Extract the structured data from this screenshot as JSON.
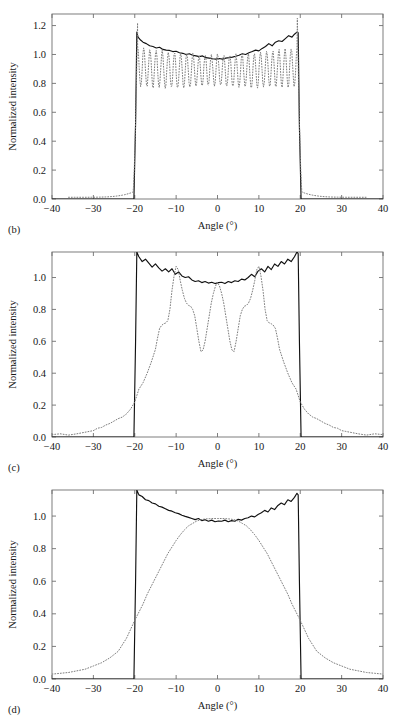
{
  "figure": {
    "title": "",
    "panel_count": 3
  },
  "chart_data": [
    {
      "type": "line",
      "panel_label": "(b)",
      "title": "",
      "xlabel": "Angle (°)",
      "ylabel": "Normalized intensity",
      "xlim": [
        -40,
        40
      ],
      "ylim": [
        0,
        1.28
      ],
      "xticks": [
        -40,
        -30,
        -20,
        -10,
        0,
        10,
        20,
        30,
        40
      ],
      "xticklabels": [
        "-40",
        "-30",
        "-20",
        "-10",
        "0",
        "10",
        "20",
        "30",
        "40"
      ],
      "yticks": [
        0.0,
        0.2,
        0.4,
        0.6,
        0.8,
        1.0,
        1.2
      ],
      "yticklabels": [
        "0.0",
        "0.2",
        "0.4",
        "0.6",
        "0.8",
        "1.0",
        "1.2"
      ],
      "grid": false,
      "legend": "none",
      "series": [
        {
          "name": "measured",
          "style": "solid",
          "color": "#111111",
          "description": "Flat-top profile with noisy ripple, rising edges at -19.5 and +19.5 degrees, peaks ~1.155 at edges, dips to ~0.965 at center",
          "x": [
            -40,
            -22,
            -20.2,
            -19.8,
            -19.5,
            -19.2,
            -18.6,
            -18.0,
            -17.2,
            -16.4,
            -15.6,
            -14.8,
            -14.0,
            -13.2,
            -12.4,
            -11.6,
            -10.8,
            -10.0,
            -9.2,
            -8.4,
            -7.6,
            -6.8,
            -6.0,
            -5.2,
            -4.4,
            -3.6,
            -2.8,
            -2.0,
            -1.2,
            -0.4,
            0.4,
            1.2,
            2.0,
            2.8,
            3.6,
            4.4,
            5.2,
            6.0,
            6.8,
            7.6,
            8.4,
            9.2,
            10.0,
            10.8,
            11.6,
            12.4,
            13.2,
            14.0,
            14.8,
            15.6,
            16.4,
            17.2,
            18.0,
            18.6,
            19.2,
            19.5,
            19.8,
            20.2,
            22,
            40
          ],
          "y": [
            0.0,
            0.0,
            0.0,
            0.52,
            1.155,
            1.12,
            1.1,
            1.085,
            1.075,
            1.06,
            1.055,
            1.045,
            1.05,
            1.035,
            1.03,
            1.028,
            1.02,
            1.022,
            1.012,
            1.008,
            1.0,
            1.005,
            0.995,
            0.99,
            0.985,
            0.99,
            0.978,
            0.975,
            0.97,
            0.968,
            0.972,
            0.968,
            0.975,
            0.978,
            0.982,
            0.988,
            0.995,
            1.005,
            1.0,
            1.012,
            1.02,
            1.03,
            1.025,
            1.042,
            1.055,
            1.075,
            1.06,
            1.085,
            1.095,
            1.09,
            1.11,
            1.13,
            1.12,
            1.14,
            1.155,
            1.15,
            0.5,
            0.0,
            0.0,
            0.0
          ]
        },
        {
          "name": "simulated",
          "style": "dotted",
          "color": "#7d7d7d",
          "description": "Strongly oscillating interference pattern with many fringes inside the aperture, tails extending to +/-35 degrees, edge spikes reaching ~1.25",
          "fringe_count": 26,
          "fringe_min": 0.78,
          "fringe_max": 1.06,
          "edge_peak": 1.25,
          "tail_extent": 36
        }
      ]
    },
    {
      "type": "line",
      "panel_label": "(c)",
      "title": "",
      "xlabel": "Angle (°)",
      "ylabel": "Normalized intensity",
      "xlim": [
        -40,
        40
      ],
      "ylim": [
        0,
        1.16
      ],
      "xticks": [
        -40,
        -30,
        -20,
        -10,
        0,
        10,
        20,
        30,
        40
      ],
      "xticklabels": [
        "-40",
        "-30",
        "-20",
        "-10",
        "0",
        "10",
        "20",
        "30",
        "40"
      ],
      "yticks": [
        0.0,
        0.2,
        0.4,
        0.6,
        0.8,
        1.0
      ],
      "yticklabels": [
        "0.0",
        "0.2",
        "0.4",
        "0.6",
        "0.8",
        "1.0"
      ],
      "grid": false,
      "legend": "none",
      "series": [
        {
          "name": "measured",
          "style": "solid",
          "color": "#111111",
          "description": "Flat-top profile clipped at top of axis at the edges, noisy ripple around 0.96 - 1.10",
          "x": [
            -40,
            -20.2,
            -19.8,
            -19.5,
            -19.0,
            -18.2,
            -17.4,
            -16.6,
            -15.8,
            -15.0,
            -14.2,
            -13.4,
            -12.6,
            -11.8,
            -11.0,
            -10.2,
            -9.4,
            -8.6,
            -7.8,
            -7.0,
            -6.2,
            -5.4,
            -4.6,
            -3.8,
            -3.0,
            -2.2,
            -1.4,
            -0.6,
            0.2,
            1.0,
            1.8,
            2.6,
            3.4,
            4.2,
            5.0,
            5.8,
            6.6,
            7.4,
            8.2,
            9.0,
            9.8,
            10.6,
            11.4,
            12.2,
            13.0,
            13.8,
            14.6,
            15.4,
            16.2,
            17.0,
            17.8,
            18.6,
            19.2,
            19.5,
            19.8,
            20.2,
            40
          ],
          "y": [
            0.0,
            0.0,
            0.6,
            1.16,
            1.13,
            1.1,
            1.115,
            1.09,
            1.065,
            1.085,
            1.06,
            1.04,
            1.055,
            1.035,
            1.055,
            1.02,
            1.035,
            1.01,
            1.0,
            1.005,
            0.985,
            0.975,
            0.98,
            0.968,
            0.975,
            0.965,
            0.97,
            0.962,
            0.968,
            0.97,
            0.962,
            0.975,
            0.968,
            0.98,
            0.975,
            0.99,
            0.985,
            1.0,
            1.02,
            1.005,
            1.04,
            1.055,
            1.035,
            1.07,
            1.05,
            1.085,
            1.07,
            1.1,
            1.085,
            1.115,
            1.1,
            1.13,
            1.16,
            1.15,
            0.6,
            0.0,
            0.0
          ]
        },
        {
          "name": "simulated",
          "style": "dotted",
          "color": "#7d7d7d",
          "description": "Four-lobed interference profile: outer peaks ~1.07 at -11 and +11 degrees, central peak ~0.97 at 0 degrees, deep minima ~0.53 at -4 and +4 degrees, broad shoulders, tails to +/-38 degrees",
          "x": [
            -40,
            -38,
            -36,
            -34,
            -32,
            -31,
            -30,
            -29,
            -28,
            -27,
            -26,
            -25,
            -24,
            -23,
            -22,
            -21,
            -20,
            -19.5,
            -19,
            -18,
            -17,
            -16,
            -15,
            -14.5,
            -14,
            -13.5,
            -13,
            -12.5,
            -12,
            -11.5,
            -11,
            -10.5,
            -10,
            -9.5,
            -9,
            -8.5,
            -8,
            -7.5,
            -7,
            -6.5,
            -6,
            -5.5,
            -5,
            -4.5,
            -4,
            -3.5,
            -3,
            -2.5,
            -2,
            -1.5,
            -1,
            -0.5,
            0,
            0.5,
            1,
            1.5,
            2,
            2.5,
            3,
            3.5,
            4,
            4.5,
            5,
            5.5,
            6,
            6.5,
            7,
            7.5,
            8,
            8.5,
            9,
            9.5,
            10,
            10.5,
            11,
            11.5,
            12,
            12.5,
            13,
            13.5,
            14,
            14.5,
            15,
            16,
            17,
            18,
            19,
            19.5,
            20,
            21,
            22,
            23,
            24,
            25,
            26,
            27,
            28,
            29,
            30,
            31,
            32,
            34,
            36,
            38,
            40
          ],
          "y": [
            0.015,
            0.02,
            0.012,
            0.02,
            0.03,
            0.035,
            0.04,
            0.055,
            0.06,
            0.075,
            0.085,
            0.1,
            0.115,
            0.125,
            0.145,
            0.175,
            0.22,
            0.26,
            0.3,
            0.34,
            0.4,
            0.47,
            0.55,
            0.62,
            0.68,
            0.7,
            0.71,
            0.715,
            0.73,
            0.8,
            0.92,
            1.01,
            1.07,
            1.05,
            0.98,
            0.92,
            0.87,
            0.84,
            0.825,
            0.82,
            0.8,
            0.76,
            0.68,
            0.6,
            0.535,
            0.545,
            0.6,
            0.68,
            0.76,
            0.84,
            0.9,
            0.945,
            0.97,
            0.945,
            0.9,
            0.84,
            0.76,
            0.68,
            0.6,
            0.545,
            0.535,
            0.6,
            0.68,
            0.76,
            0.8,
            0.82,
            0.825,
            0.84,
            0.87,
            0.92,
            0.98,
            1.05,
            1.07,
            1.01,
            0.92,
            0.8,
            0.73,
            0.715,
            0.71,
            0.7,
            0.68,
            0.62,
            0.55,
            0.47,
            0.4,
            0.34,
            0.3,
            0.26,
            0.22,
            0.175,
            0.145,
            0.125,
            0.115,
            0.1,
            0.085,
            0.075,
            0.06,
            0.055,
            0.04,
            0.035,
            0.03,
            0.02,
            0.012,
            0.02,
            0.015
          ]
        }
      ]
    },
    {
      "type": "line",
      "panel_label": "(d)",
      "title": "",
      "xlabel": "Angle (°)",
      "ylabel": "Normalized intensity",
      "xlim": [
        -40,
        40
      ],
      "ylim": [
        0,
        1.16
      ],
      "xticks": [
        -40,
        -30,
        -20,
        -10,
        0,
        10,
        20,
        30,
        40
      ],
      "xticklabels": [
        "-40",
        "-30",
        "-20",
        "-10",
        "0",
        "10",
        "20",
        "30",
        "40"
      ],
      "yticks": [
        0.0,
        0.2,
        0.4,
        0.6,
        0.8,
        1.0
      ],
      "yticklabels": [
        "0.0",
        "0.2",
        "0.4",
        "0.6",
        "0.8",
        "1.0"
      ],
      "grid": false,
      "legend": "none",
      "series": [
        {
          "name": "measured",
          "style": "solid",
          "color": "#111111",
          "description": "Flat-top profile clipped at top of axis at the edges, shallow noisy ripple around 0.96 - 1.13",
          "x": [
            -40,
            -20.2,
            -19.8,
            -19.5,
            -19.0,
            -18.2,
            -17.4,
            -16.6,
            -15.8,
            -15.0,
            -14.2,
            -13.4,
            -12.6,
            -11.8,
            -11.0,
            -10.2,
            -9.4,
            -8.6,
            -7.8,
            -7.0,
            -6.2,
            -5.4,
            -4.6,
            -3.8,
            -3.0,
            -2.2,
            -1.4,
            -0.6,
            0.2,
            1.0,
            1.8,
            2.6,
            3.4,
            4.2,
            5.0,
            5.8,
            6.6,
            7.4,
            8.2,
            9.0,
            9.8,
            10.6,
            11.4,
            12.2,
            13.0,
            13.8,
            14.6,
            15.4,
            16.2,
            17.0,
            17.8,
            18.6,
            19.2,
            19.5,
            19.8,
            20.2,
            40
          ],
          "y": [
            0.0,
            0.0,
            0.6,
            1.16,
            1.13,
            1.12,
            1.1,
            1.095,
            1.08,
            1.075,
            1.06,
            1.055,
            1.045,
            1.035,
            1.03,
            1.02,
            1.015,
            1.005,
            0.998,
            0.992,
            0.985,
            0.978,
            0.985,
            0.972,
            0.978,
            0.968,
            0.975,
            0.965,
            0.97,
            0.968,
            0.975,
            0.965,
            0.972,
            0.968,
            0.98,
            0.975,
            0.985,
            0.99,
            1.0,
            0.995,
            1.01,
            1.02,
            1.035,
            1.025,
            1.05,
            1.04,
            1.065,
            1.08,
            1.07,
            1.1,
            1.09,
            1.115,
            1.14,
            1.13,
            0.6,
            0.0,
            0.0
          ]
        },
        {
          "name": "simulated",
          "style": "dotted",
          "color": "#7d7d7d",
          "description": "Smooth broad Gaussian-like profile peaking at 0.985 at 0 degrees, half maximum near +/-13 degrees, falling to ~0.03 at +/-40 degrees",
          "x": [
            -40,
            -38,
            -36,
            -34,
            -32,
            -30,
            -28,
            -26,
            -24,
            -22,
            -20,
            -19,
            -18,
            -17,
            -16,
            -15,
            -14,
            -13,
            -12,
            -11,
            -10,
            -9,
            -8,
            -7,
            -6,
            -5,
            -4,
            -3,
            -2,
            -1,
            0,
            1,
            2,
            3,
            4,
            5,
            6,
            7,
            8,
            9,
            10,
            11,
            12,
            13,
            14,
            15,
            16,
            17,
            18,
            19,
            20,
            22,
            24,
            26,
            28,
            30,
            32,
            34,
            36,
            38,
            40
          ],
          "y": [
            0.03,
            0.035,
            0.04,
            0.05,
            0.06,
            0.08,
            0.1,
            0.13,
            0.17,
            0.25,
            0.36,
            0.41,
            0.46,
            0.52,
            0.57,
            0.62,
            0.67,
            0.72,
            0.77,
            0.81,
            0.85,
            0.885,
            0.915,
            0.94,
            0.955,
            0.97,
            0.978,
            0.982,
            0.984,
            0.985,
            0.985,
            0.985,
            0.984,
            0.982,
            0.978,
            0.97,
            0.955,
            0.94,
            0.915,
            0.885,
            0.85,
            0.81,
            0.77,
            0.72,
            0.67,
            0.62,
            0.57,
            0.52,
            0.46,
            0.41,
            0.36,
            0.25,
            0.17,
            0.13,
            0.1,
            0.08,
            0.06,
            0.05,
            0.04,
            0.035,
            0.03
          ]
        }
      ]
    }
  ],
  "colors": {
    "solid_curve": "#111111",
    "dotted_curve": "#7d7d7d",
    "frame": "#6f6f6f",
    "text": "#171717",
    "background": "#ffffff"
  }
}
